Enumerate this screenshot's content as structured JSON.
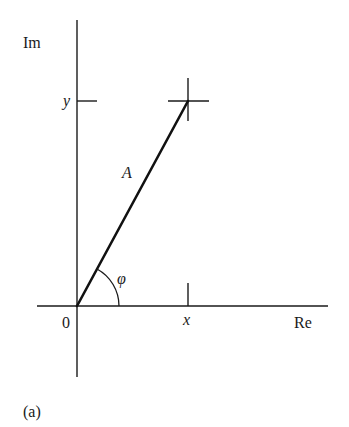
{
  "figure": {
    "panel_label": "(a)",
    "axes": {
      "vertical_label": "Im",
      "horizontal_label": "Re",
      "origin_label": "0"
    },
    "ticks": {
      "x_label": "x",
      "y_label": "y"
    },
    "vector": {
      "magnitude_label": "A",
      "angle_label": "φ"
    },
    "colors": {
      "stroke": "#1a1a1a",
      "background": "#ffffff"
    }
  }
}
